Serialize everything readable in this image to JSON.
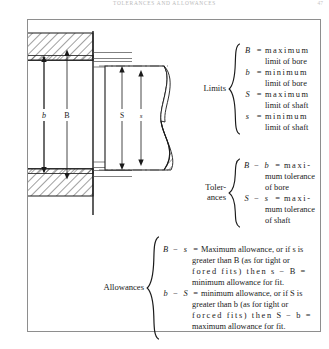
{
  "page": {
    "running_head": "TOLERANCES AND ALLOWANCES",
    "folio": "47"
  },
  "diagram": {
    "name": "bore-and-shaft-limits-diagram",
    "labels": {
      "bore_min": "b",
      "bore_max": "B",
      "shaft_max": "S",
      "shaft_min": "s"
    }
  },
  "limits": {
    "label": "Limits",
    "entries": [
      {
        "symbol": "B",
        "operator": "=",
        "value": "maximum",
        "continuation": "limit of bore"
      },
      {
        "symbol": "b",
        "operator": "=",
        "value": "minimum",
        "continuation": "limit of bore"
      },
      {
        "symbol": "S",
        "operator": "=",
        "value": "maximum",
        "continuation": "limit of shaft"
      },
      {
        "symbol": "s",
        "operator": "=",
        "value": "minimum",
        "continuation": "limit of shaft"
      }
    ]
  },
  "tolerances": {
    "label_line1": "Toler-",
    "label_line2": "ances",
    "entries": [
      {
        "lhs_a": "B",
        "minus": "−",
        "lhs_b": "b",
        "operator": "=",
        "value": "maxi-",
        "continuation1": "mum tolerance",
        "continuation2": "of bore"
      },
      {
        "lhs_a": "S",
        "minus": "−",
        "lhs_b": "s",
        "operator": "=",
        "value": "maxi-",
        "continuation1": "mum tolerance",
        "continuation2": "of shaft"
      }
    ]
  },
  "allowances": {
    "label": "Allowances",
    "entries": [
      {
        "lhs_a": "B",
        "minus": "−",
        "lhs_b": "s",
        "operator": "=",
        "line1": "Maximum allowance, or if s is",
        "line2": "greater than B (as for tight or",
        "line3": "fored fits) then s − B =",
        "line4": "minimum allowance for fit."
      },
      {
        "lhs_a": "b",
        "minus": "−",
        "lhs_b": "S",
        "operator": "=",
        "line1": "minimum allowance, or if S is",
        "line2": "greater than b (as for tight or",
        "line3": "forced fits) then S − b =",
        "line4": "maximum allowance for fit."
      }
    ]
  }
}
